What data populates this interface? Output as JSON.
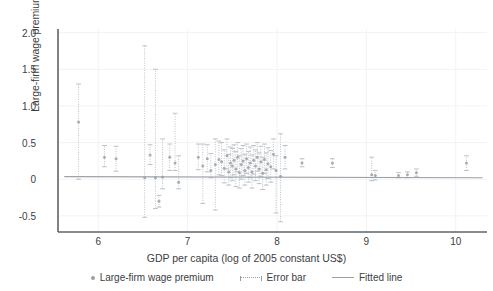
{
  "chart_data": {
    "type": "scatter",
    "title": "",
    "xlabel": "GDP per capita (log of 2005 constant US$)",
    "ylabel": "Large-firm wage premium",
    "xlim": [
      5.55,
      10.35
    ],
    "ylim": [
      -0.72,
      2.05
    ],
    "xticks": [
      6,
      7,
      8,
      9,
      10
    ],
    "xticklabels": [
      "6",
      "7",
      "8",
      "9",
      "10"
    ],
    "yticks": [
      -0.5,
      0,
      0.5,
      1.0,
      1.5,
      2.0
    ],
    "yticklabels": [
      "-0.5",
      "0",
      "0.5",
      "1.0",
      "1.5",
      "2.0"
    ],
    "grid": true,
    "grid_color": "#f1f3f4",
    "legend_position": "below",
    "marker_color": "#9aa0a6",
    "errorbar_color": "#bdc1c6",
    "fitted_line_color": "#9aa0a6",
    "legend": [
      {
        "label": "Large-firm wage premium",
        "style": "dot"
      },
      {
        "label": "Error bar",
        "style": "dotted-capped-line"
      },
      {
        "label": "Fitted line",
        "style": "solid-line"
      }
    ],
    "fitted_line": {
      "x0": 5.62,
      "y0": 0.035,
      "x1": 10.3,
      "y1": 0.02
    },
    "series": [
      {
        "name": "Large-firm wage premium",
        "points": [
          {
            "x": 5.78,
            "y": 0.78,
            "lo": 0.0,
            "hi": 1.3
          },
          {
            "x": 6.07,
            "y": 0.3,
            "lo": 0.17,
            "hi": 0.46
          },
          {
            "x": 6.2,
            "y": 0.28,
            "lo": 0.11,
            "hi": 0.45
          },
          {
            "x": 6.52,
            "y": 0.02,
            "lo": -0.52,
            "hi": 1.82
          },
          {
            "x": 6.58,
            "y": 0.33,
            "lo": 0.2,
            "hi": 0.47
          },
          {
            "x": 6.64,
            "y": 0.02,
            "lo": -0.4,
            "hi": 1.5
          },
          {
            "x": 6.68,
            "y": -0.3,
            "lo": -0.38,
            "hi": -0.22
          },
          {
            "x": 6.72,
            "y": 0.03,
            "lo": -0.13,
            "hi": 0.55
          },
          {
            "x": 6.8,
            "y": 0.3,
            "lo": 0.12,
            "hi": 0.48
          },
          {
            "x": 6.86,
            "y": 0.22,
            "lo": 0.12,
            "hi": 0.9
          },
          {
            "x": 6.9,
            "y": -0.04,
            "lo": -0.13,
            "hi": 0.32
          },
          {
            "x": 7.12,
            "y": 0.3,
            "lo": 0.13,
            "hi": 0.48
          },
          {
            "x": 7.17,
            "y": 0.18,
            "lo": -0.33,
            "hi": 0.48
          },
          {
            "x": 7.22,
            "y": 0.28,
            "lo": 0.1,
            "hi": 0.47
          },
          {
            "x": 7.26,
            "y": 0.12,
            "lo": 0.02,
            "hi": 0.35
          },
          {
            "x": 7.31,
            "y": 0.2,
            "lo": -0.42,
            "hi": 0.55
          },
          {
            "x": 7.35,
            "y": 0.27,
            "lo": 0.06,
            "hi": 0.52
          },
          {
            "x": 7.38,
            "y": 0.24,
            "lo": 0.05,
            "hi": 0.5
          },
          {
            "x": 7.41,
            "y": 0.15,
            "lo": -0.05,
            "hi": 0.4
          },
          {
            "x": 7.44,
            "y": 0.32,
            "lo": 0.14,
            "hi": 0.55
          },
          {
            "x": 7.46,
            "y": 0.1,
            "lo": -0.08,
            "hi": 0.34
          },
          {
            "x": 7.48,
            "y": 0.22,
            "lo": 0.02,
            "hi": 0.44
          },
          {
            "x": 7.5,
            "y": 0.18,
            "lo": -0.02,
            "hi": 0.42
          },
          {
            "x": 7.52,
            "y": 0.26,
            "lo": 0.06,
            "hi": 0.47
          },
          {
            "x": 7.54,
            "y": 0.14,
            "lo": -0.1,
            "hi": 0.38
          },
          {
            "x": 7.56,
            "y": 0.3,
            "lo": 0.1,
            "hi": 0.5
          },
          {
            "x": 7.58,
            "y": 0.09,
            "lo": -0.12,
            "hi": 0.32
          },
          {
            "x": 7.6,
            "y": 0.2,
            "lo": 0.0,
            "hi": 0.42
          },
          {
            "x": 7.62,
            "y": 0.25,
            "lo": 0.05,
            "hi": 0.46
          },
          {
            "x": 7.64,
            "y": 0.12,
            "lo": -0.08,
            "hi": 0.34
          },
          {
            "x": 7.66,
            "y": 0.28,
            "lo": 0.08,
            "hi": 0.48
          },
          {
            "x": 7.68,
            "y": 0.16,
            "lo": -0.04,
            "hi": 0.38
          },
          {
            "x": 7.7,
            "y": 0.22,
            "lo": 0.02,
            "hi": 0.44
          },
          {
            "x": 7.72,
            "y": 0.1,
            "lo": -0.12,
            "hi": 0.33
          },
          {
            "x": 7.74,
            "y": 0.26,
            "lo": 0.07,
            "hi": 0.46
          },
          {
            "x": 7.76,
            "y": 0.18,
            "lo": -0.02,
            "hi": 0.4
          },
          {
            "x": 7.78,
            "y": 0.3,
            "lo": 0.11,
            "hi": 0.5
          },
          {
            "x": 7.8,
            "y": 0.14,
            "lo": -0.06,
            "hi": 0.36
          },
          {
            "x": 7.82,
            "y": 0.24,
            "lo": 0.04,
            "hi": 0.45
          },
          {
            "x": 7.84,
            "y": 0.08,
            "lo": -0.14,
            "hi": 0.3
          },
          {
            "x": 7.86,
            "y": 0.27,
            "lo": 0.08,
            "hi": 0.48
          },
          {
            "x": 7.88,
            "y": 0.13,
            "lo": -0.08,
            "hi": 0.36
          },
          {
            "x": 7.9,
            "y": 0.21,
            "lo": 0.01,
            "hi": 0.43
          },
          {
            "x": 7.93,
            "y": 0.17,
            "lo": -0.04,
            "hi": 0.39
          },
          {
            "x": 7.96,
            "y": 0.34,
            "lo": 0.14,
            "hi": 0.55
          },
          {
            "x": 7.99,
            "y": 0.12,
            "lo": -0.46,
            "hi": 0.32
          },
          {
            "x": 8.04,
            "y": 0.04,
            "lo": -0.58,
            "hi": 0.62
          },
          {
            "x": 8.09,
            "y": 0.3,
            "lo": 0.14,
            "hi": 0.46
          },
          {
            "x": 8.28,
            "y": 0.22,
            "lo": 0.17,
            "hi": 0.28
          },
          {
            "x": 8.62,
            "y": 0.22,
            "lo": 0.16,
            "hi": 0.28
          },
          {
            "x": 9.06,
            "y": 0.06,
            "lo": -0.02,
            "hi": 0.3
          },
          {
            "x": 9.1,
            "y": 0.05,
            "lo": -0.01,
            "hi": 0.12
          },
          {
            "x": 9.36,
            "y": 0.05,
            "lo": 0.02,
            "hi": 0.09
          },
          {
            "x": 9.46,
            "y": 0.06,
            "lo": 0.02,
            "hi": 0.1
          },
          {
            "x": 9.56,
            "y": 0.09,
            "lo": 0.04,
            "hi": 0.14
          },
          {
            "x": 10.12,
            "y": 0.22,
            "lo": 0.12,
            "hi": 0.32
          }
        ]
      }
    ]
  }
}
